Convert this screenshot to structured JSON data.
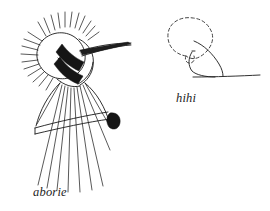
{
  "canvas": {
    "width": 270,
    "height": 211,
    "background": "#ffffff",
    "ink_color": "#1a1a1a",
    "dashed_ink_color": "#3a3a3a",
    "fill_color": "#151515"
  },
  "figures": [
    {
      "id": "left-figure",
      "caption": "aborie",
      "description": "spiked oval head with banded neck, long tapering needle to the right, and a flared skirt of long vertical strokes crossed by a slanted band",
      "parts": [
        "spiked-oval-head",
        "radiating-spikes",
        "stippled-band-upper",
        "stippled-band-lower",
        "needle-proboscis",
        "skirt-strokes",
        "slanted-waist-band",
        "dark-blob"
      ]
    },
    {
      "id": "right-figure",
      "caption": "hihi",
      "description": "dashed mushroom-cap outline with a solid stem curve meeting a horizontal baseline",
      "parts": [
        "dashed-cap-outline",
        "solid-stem-curve",
        "solid-inner-curve",
        "baseline"
      ]
    }
  ],
  "captions": {
    "left": "aborie",
    "right": "hihi"
  }
}
